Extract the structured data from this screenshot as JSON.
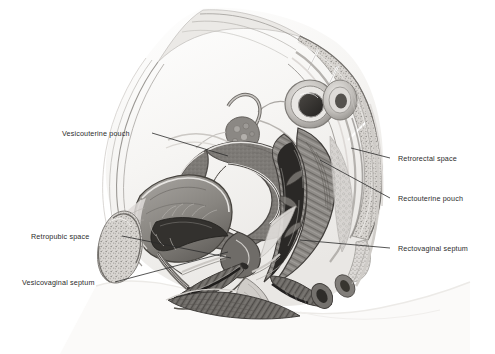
{
  "figure": {
    "style": "grayscale medical illustration",
    "background_color": "#ffffff",
    "ink_color": "#2b2b2b",
    "tissue_tones": {
      "light": "#e6e4e2",
      "mid": "#b9b6b3",
      "dark": "#7d7a78",
      "darkest": "#3a3836",
      "skin_outline": "#f2f0ee"
    }
  },
  "labels": {
    "left": [
      {
        "id": "vesicouterine-pouch",
        "text": "Vesicouterine pouch",
        "x": 62,
        "y": 129
      },
      {
        "id": "retropubic-space",
        "text": "Retropubic space",
        "x": 31,
        "y": 232
      },
      {
        "id": "vesicovaginal-septum",
        "text": "Vesicovaginal septum",
        "x": 22,
        "y": 278
      }
    ],
    "right": [
      {
        "id": "retrorectal-space",
        "text": "Retrorectal space",
        "x": 398,
        "y": 154
      },
      {
        "id": "rectouterine-pouch",
        "text": "Rectouterine pouch",
        "x": 398,
        "y": 194
      },
      {
        "id": "rectovaginal-septum",
        "text": "Rectovaginal septum",
        "x": 398,
        "y": 244
      }
    ]
  },
  "leader_lines": [
    {
      "id": "leader-vesicouterine-pouch",
      "from": [
        152,
        133
      ],
      "to": [
        228,
        156
      ]
    },
    {
      "id": "leader-retropubic-space",
      "from": [
        122,
        236
      ],
      "to": [
        231,
        258
      ]
    },
    {
      "id": "leader-vesicovaginal-septum",
      "from": [
        115,
        282
      ],
      "to": [
        228,
        252
      ]
    },
    {
      "id": "leader-retrorectal-space",
      "from": [
        390,
        158
      ],
      "to": [
        351,
        148
      ]
    },
    {
      "id": "leader-rectouterine-pouch",
      "from": [
        390,
        198
      ],
      "to": [
        320,
        160
      ]
    },
    {
      "id": "leader-rectovaginal-septum",
      "from": [
        390,
        248
      ],
      "to": [
        300,
        240
      ]
    }
  ],
  "anatomy": [
    {
      "id": "abdominal-wall",
      "name": "Anterior abdominal wall"
    },
    {
      "id": "sacrum",
      "name": "Sacrum with cancellous bone"
    },
    {
      "id": "sigmoid-colon",
      "name": "Sigmoid colon cross-section"
    },
    {
      "id": "ovary",
      "name": "Ovary"
    },
    {
      "id": "uterine-tube",
      "name": "Uterine tube"
    },
    {
      "id": "uterus",
      "name": "Uterus (anteverted)"
    },
    {
      "id": "uterine-cavity",
      "name": "Uterine cavity"
    },
    {
      "id": "cervix",
      "name": "Cervix"
    },
    {
      "id": "bladder",
      "name": "Urinary bladder"
    },
    {
      "id": "pubic-bone",
      "name": "Pubic bone"
    },
    {
      "id": "urethra",
      "name": "Urethra"
    },
    {
      "id": "vagina",
      "name": "Vagina"
    },
    {
      "id": "rectum",
      "name": "Rectum with transverse folds"
    },
    {
      "id": "anal-canal",
      "name": "Anal canal"
    },
    {
      "id": "perineum",
      "name": "Perineum"
    },
    {
      "id": "body-contour",
      "name": "Body surface contour"
    }
  ]
}
